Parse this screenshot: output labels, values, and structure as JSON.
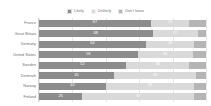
{
  "chart_data": {
    "type": "bar",
    "subtype": "stacked-horizontal-100pct",
    "title": "",
    "subtitle": "",
    "xlabel": "",
    "ylabel": "",
    "xlim": [
      0,
      100
    ],
    "grid": true,
    "grid_axis": "x",
    "gridline_values": [
      0,
      20,
      40,
      60,
      80,
      100
    ],
    "legend_position": "top-center",
    "orientation": "horizontal",
    "categories": [
      "France",
      "Great Britain",
      "Germany",
      "United States",
      "Sweden",
      "Denmark",
      "Norway",
      "Finland"
    ],
    "series": [
      {
        "name": "Likely",
        "color": "#8c8c8c",
        "values": [
          67,
          68,
          64,
          59,
          52,
          45,
          40,
          26
        ]
      },
      {
        "name": "Unlikely",
        "color": "#d9d9d9",
        "values": [
          23,
          27,
          29,
          33,
          38,
          49,
          53,
          67
        ]
      },
      {
        "name": "Don't know",
        "color": "#b5b5b5",
        "values": [
          10,
          5,
          7,
          8,
          10,
          6,
          7,
          7
        ]
      }
    ],
    "value_labels_shown": {
      "Likely": [
        67,
        68,
        64,
        59,
        52,
        45,
        40,
        26
      ],
      "Unlikely": [
        23,
        27,
        29,
        33,
        38,
        49,
        53,
        67
      ],
      "Don't know": [
        null,
        null,
        null,
        null,
        null,
        null,
        null,
        null
      ]
    }
  },
  "legend": {
    "entries": [
      {
        "label": "Likely",
        "color": "#8c8c8c",
        "swatch_name": "legend-swatch-likely"
      },
      {
        "label": "Unlikely",
        "color": "#d9d9d9",
        "swatch_name": "legend-swatch-unlikely"
      },
      {
        "label": "Don't know",
        "color": "#b5b5b5",
        "swatch_name": "legend-swatch-dontknow"
      }
    ]
  },
  "colors": {
    "likely": "#8c8c8c",
    "unlikely": "#d9d9d9",
    "dontknow": "#b5b5b5",
    "background": "#ffffff",
    "gridline": "#e8e8e8",
    "axis": "#d4d4d4",
    "label_text": "#6e6e6e",
    "value_text": "#ffffff"
  }
}
